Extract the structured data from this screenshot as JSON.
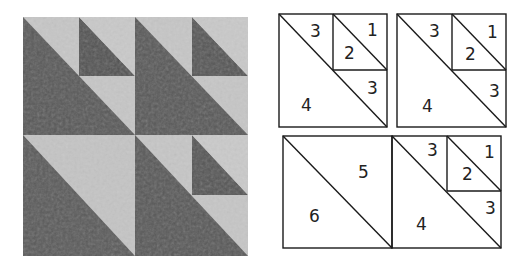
{
  "quilt": {
    "colors": {
      "dark": "#585858",
      "light": "#c6c6c6",
      "mid": "#6a6a6a"
    }
  },
  "diagram": {
    "line_color": "#1a1a1a",
    "top_left_unit": {
      "labels": {
        "a": "3",
        "b": "1",
        "c": "2",
        "d": "3",
        "e": "4"
      }
    },
    "top_right_unit": {
      "labels": {
        "a": "3",
        "b": "1",
        "c": "2",
        "d": "3",
        "e": "4"
      }
    },
    "bottom_left_unit": {
      "labels": {
        "a": "5",
        "b": "6"
      }
    },
    "bottom_right_unit": {
      "labels": {
        "a": "3",
        "b": "1",
        "c": "2",
        "d": "3",
        "e": "4"
      }
    }
  }
}
